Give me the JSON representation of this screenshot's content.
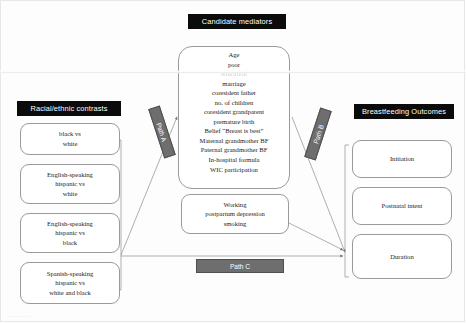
{
  "figure": {
    "title_banners": {
      "mediators": "Candidate mediators",
      "contrasts": "Racial/ethnic contrasts",
      "outcomes": "Breastfeeding Outcomes"
    },
    "caption_fragment": "..........."
  },
  "contrasts": {
    "items": [
      {
        "id": "black-vs-white",
        "text": "black vs\nwhite"
      },
      {
        "id": "eng-hispanic-vs-white",
        "text": "English-speaking\nhispanic vs\nwhite"
      },
      {
        "id": "eng-hispanic-vs-black",
        "text": "English-speaking\nhispanic vs\nblack"
      },
      {
        "id": "spa-hispanic-vs-white-black",
        "text": "Spanish-speaking\nhispanic vs\nwhite and black"
      }
    ]
  },
  "mediators": {
    "primary": [
      "Age",
      "poor",
      "education",
      "marriage",
      "coresident father",
      "no. of  children",
      "coresident grandparent",
      "premature birth",
      "Belief “Breast is best”",
      "Maternal grandmother BF",
      "Paternal grandmother BF",
      "In-hospital formula",
      "WIC participation"
    ],
    "primary_faded_index": 2,
    "secondary": [
      "Working",
      "postpartum depression",
      "smoking"
    ]
  },
  "outcomes": {
    "items": [
      {
        "id": "initiation",
        "text": "Initiation"
      },
      {
        "id": "postnatal-intent",
        "text": "Postnatal intent"
      },
      {
        "id": "duration",
        "text": "Duration"
      }
    ]
  },
  "paths": {
    "a": "Path A",
    "b": "Path B",
    "c": "Path C"
  },
  "colors": {
    "banner_bg": "#0b0b0b",
    "banner_text": "#ffffff",
    "path_tag_bg": "#6e6e6e",
    "box_border": "#9a9a9a",
    "link_line": "#8d8d8d",
    "page_bg": "#ffffff"
  }
}
